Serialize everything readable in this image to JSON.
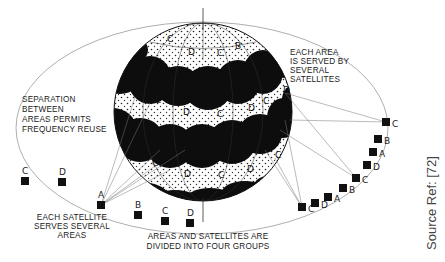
{
  "annotations": {
    "separation": [
      "SEPARATION",
      "BETWEEN",
      "AREAS PERMITS",
      "FREQUENCY REUSE"
    ],
    "each_area": [
      "EACH AREA",
      "IS SERVED BY",
      "SEVERAL",
      "SATELLITES"
    ],
    "each_satellite": [
      "EACH SATELLITE",
      "SERVES SEVERAL",
      "AREAS"
    ],
    "groups": [
      "AREAS AND SATELLITES ARE",
      "DIVIDED INTO FOUR GROUPS"
    ]
  },
  "source_ref": "Source Ref: [72]",
  "satellites": [
    {
      "label": "C",
      "x": 25,
      "y": 181
    },
    {
      "label": "D",
      "x": 62,
      "y": 182
    },
    {
      "label": "A",
      "x": 101,
      "y": 205
    },
    {
      "label": "B",
      "x": 138,
      "y": 215
    },
    {
      "label": "C",
      "x": 165,
      "y": 221
    },
    {
      "label": "D",
      "x": 190,
      "y": 223
    },
    {
      "label": "C",
      "x": 302,
      "y": 207
    },
    {
      "label": "D",
      "x": 315,
      "y": 203
    },
    {
      "label": "A",
      "x": 328,
      "y": 197
    },
    {
      "label": "B",
      "x": 343,
      "y": 188
    },
    {
      "label": "C",
      "x": 356,
      "y": 178
    },
    {
      "label": "D",
      "x": 367,
      "y": 165
    },
    {
      "label": "A",
      "x": 373,
      "y": 152
    },
    {
      "label": "B",
      "x": 378,
      "y": 139
    },
    {
      "label": "C",
      "x": 386,
      "y": 122
    }
  ],
  "area_labels": [
    {
      "label": "C",
      "x": 167,
      "y": 42
    },
    {
      "label": "D",
      "x": 188,
      "y": 55
    },
    {
      "label": "C",
      "x": 217,
      "y": 56
    },
    {
      "label": "B",
      "x": 235,
      "y": 49
    },
    {
      "label": "D",
      "x": 135,
      "y": 97
    },
    {
      "label": "C",
      "x": 155,
      "y": 103
    },
    {
      "label": "D",
      "x": 183,
      "y": 115
    },
    {
      "label": "C",
      "x": 217,
      "y": 117
    },
    {
      "label": "D",
      "x": 248,
      "y": 111
    },
    {
      "label": "C",
      "x": 263,
      "y": 104
    },
    {
      "label": "D",
      "x": 283,
      "y": 93
    },
    {
      "label": "C",
      "x": 152,
      "y": 166
    },
    {
      "label": "D",
      "x": 184,
      "y": 177
    },
    {
      "label": "C",
      "x": 218,
      "y": 178
    },
    {
      "label": "D",
      "x": 247,
      "y": 172
    },
    {
      "label": "C",
      "x": 275,
      "y": 158
    }
  ],
  "colors": {
    "ink": "#111111",
    "line": "#888888",
    "background": "#ffffff"
  }
}
